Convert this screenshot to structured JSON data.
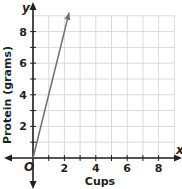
{
  "chart_data": {
    "type": "line",
    "title": "",
    "xlabel": "Cups",
    "ylabel": "Protein (grams)",
    "x_axis_var": "x",
    "y_axis_var": "y",
    "origin_label": "O",
    "xlim": [
      0,
      9
    ],
    "ylim": [
      0,
      9
    ],
    "x_ticks": [
      2,
      4,
      6,
      8
    ],
    "y_ticks": [
      2,
      4,
      6,
      8
    ],
    "grid": true,
    "grid_step": 1,
    "series": [
      {
        "name": "Protein",
        "x": [
          0,
          1,
          2,
          2.3
        ],
        "y": [
          0,
          4,
          8,
          9.2
        ],
        "slope": 4,
        "arrow_end": true
      }
    ]
  },
  "colors": {
    "grid": "#d9d9d9",
    "axis": "#231f20",
    "line": "#6d6e71",
    "text": "#231f20"
  }
}
